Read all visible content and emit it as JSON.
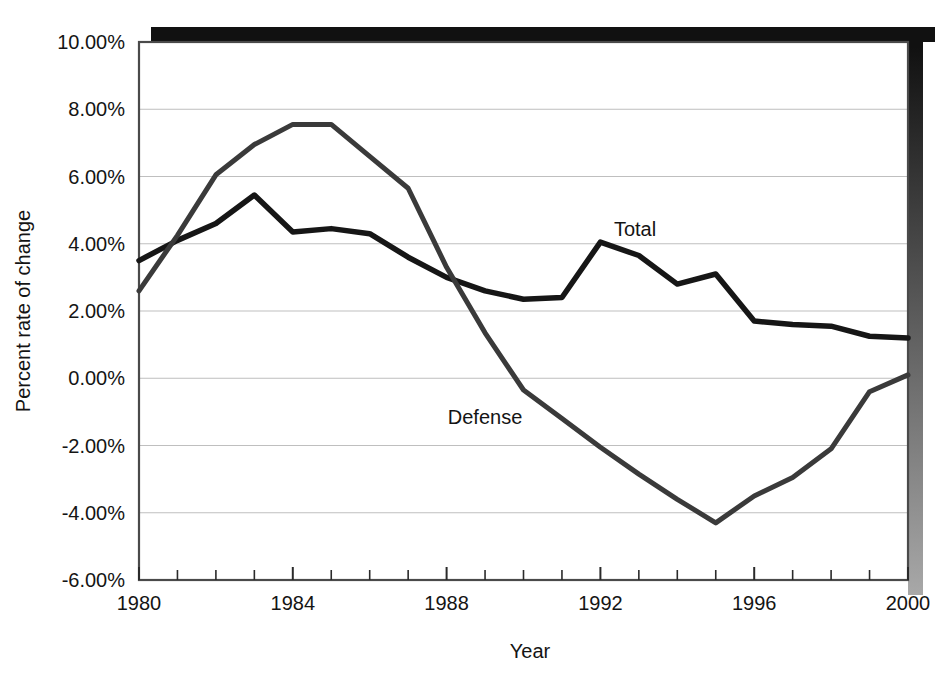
{
  "chart_data": {
    "type": "line",
    "title": "",
    "xlabel": "Year",
    "ylabel": "Percent rate of change",
    "xlim": [
      1980,
      2000
    ],
    "ylim": [
      -6,
      10
    ],
    "grid": true,
    "grid_axis": "y",
    "legend_position": "inline-annotation",
    "x": [
      1980,
      1981,
      1982,
      1983,
      1984,
      1985,
      1986,
      1987,
      1988,
      1989,
      1990,
      1991,
      1992,
      1993,
      1994,
      1995,
      1996,
      1997,
      1998,
      1999,
      2000
    ],
    "x_tick_values": [
      1980,
      1984,
      1988,
      1992,
      1996,
      2000
    ],
    "x_tick_labels": [
      "1980",
      "1984",
      "1988",
      "1992",
      "1996",
      "2000"
    ],
    "x_minor_tick_interval": 1,
    "y_tick_values": [
      -6,
      -4,
      -2,
      0,
      2,
      4,
      6,
      8,
      10
    ],
    "y_tick_labels": [
      "-6.00%",
      "-4.00%",
      "-2.00%",
      "0.00%",
      "2.00%",
      "4.00%",
      "6.00%",
      "8.00%",
      "10.00%"
    ],
    "series": [
      {
        "name": "Total",
        "color": "#161616",
        "line_width": 5.5,
        "annotation": "Total",
        "annotation_x": 1992.9,
        "annotation_y": 4.45,
        "values": [
          3.5,
          4.1,
          4.6,
          5.45,
          4.35,
          4.45,
          4.3,
          3.6,
          3.0,
          2.6,
          2.35,
          2.4,
          4.05,
          3.65,
          2.8,
          3.1,
          1.7,
          1.6,
          1.55,
          1.25,
          1.2
        ]
      },
      {
        "name": "Defense",
        "color": "#3a3a3a",
        "line_width": 5.0,
        "annotation": "Defense",
        "annotation_x": 1989.0,
        "annotation_y": -1.15,
        "values": [
          2.6,
          4.25,
          6.05,
          6.95,
          7.55,
          7.55,
          6.6,
          5.65,
          3.3,
          1.35,
          -0.35,
          -1.2,
          -2.05,
          -2.85,
          -3.6,
          -4.3,
          -3.5,
          -2.95,
          -2.1,
          -0.4,
          0.1
        ]
      }
    ]
  },
  "axes": {
    "y_axis_label": "Percent rate of change",
    "x_axis_label": "Year"
  },
  "style": {
    "plot_background": "#ffffff",
    "grid_color": "#bfbfbf",
    "axis_color": "#4a4a4a",
    "shadow_color": "#111111",
    "shadow_edge_color": "#8a8a8a"
  }
}
